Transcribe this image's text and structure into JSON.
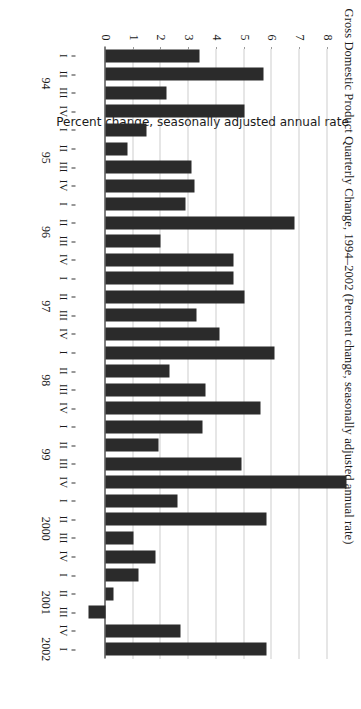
{
  "figure": {
    "title": "Gross Domestic Product Quarterly Change, 1994–2002 (Percent change, seasonally adjusted annual rate)",
    "ylabel": "Percent change, seasonally adjusted annual rate"
  },
  "chart_data": {
    "type": "bar",
    "title": "Gross Domestic Product Quarterly Change, 1994–2002 (Percent change, seasonally adjusted annual rate)",
    "xlabel": "",
    "ylabel": "Percent change, seasonally adjusted annual rate",
    "ylim": [
      -1,
      8
    ],
    "yticks": [
      0,
      1,
      2,
      3,
      4,
      5,
      6,
      7,
      8
    ],
    "ytick_labels": [
      "0",
      "1",
      "2",
      "3",
      "4",
      "5",
      "6",
      "7",
      "8"
    ],
    "grid": true,
    "legend": false,
    "orientation": "vertical",
    "categories": [
      "I",
      "II",
      "III",
      "IV",
      "I",
      "II",
      "III",
      "IV",
      "I",
      "II",
      "III",
      "IV",
      "I",
      "II",
      "III",
      "IV",
      "I",
      "II",
      "III",
      "IV",
      "I",
      "II",
      "III",
      "IV",
      "I",
      "II",
      "III",
      "IV",
      "I",
      "II",
      "III",
      "IV",
      "I"
    ],
    "year_groups": [
      {
        "label": "94",
        "start": 0,
        "count": 4
      },
      {
        "label": "95",
        "start": 4,
        "count": 4
      },
      {
        "label": "96",
        "start": 8,
        "count": 4
      },
      {
        "label": "97",
        "start": 12,
        "count": 4
      },
      {
        "label": "98",
        "start": 16,
        "count": 4
      },
      {
        "label": "99",
        "start": 20,
        "count": 4
      },
      {
        "label": "2000",
        "start": 24,
        "count": 4
      },
      {
        "label": "2001",
        "start": 28,
        "count": 4
      },
      {
        "label": "2002",
        "start": 32,
        "count": 1
      }
    ],
    "values": [
      3.4,
      5.7,
      2.2,
      5.0,
      1.5,
      0.8,
      3.1,
      3.2,
      2.9,
      6.8,
      2.0,
      4.6,
      4.6,
      5.0,
      3.3,
      4.1,
      6.1,
      2.3,
      3.6,
      5.6,
      3.5,
      1.9,
      4.9,
      8.7,
      2.6,
      5.8,
      1.0,
      1.8,
      1.2,
      0.3,
      -0.6,
      2.7,
      5.8
    ]
  }
}
